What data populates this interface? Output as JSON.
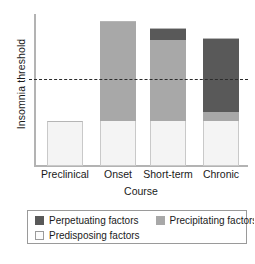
{
  "chart_data": {
    "type": "bar",
    "stacked": true,
    "title": "",
    "xlabel": "Course",
    "ylabel": "Insomnia threshold",
    "categories": [
      "Preclinical",
      "Onset",
      "Short-term",
      "Chronic"
    ],
    "series": [
      {
        "name": "Predisposing factors",
        "color": "#f4f4f4",
        "values": [
          45,
          45,
          45,
          45
        ]
      },
      {
        "name": "Precipitating factors",
        "color": "#a8a8a8",
        "values": [
          0,
          100,
          81,
          9
        ]
      },
      {
        "name": "Perpetuating factors",
        "color": "#595959",
        "values": [
          0,
          0,
          12,
          74
        ]
      }
    ],
    "totals": [
      45,
      145,
      138,
      128
    ],
    "threshold": {
      "label": "Insomnia threshold",
      "value": 87,
      "style": "dashed",
      "color": "#2b2b2b"
    },
    "ylim": [
      0,
      152
    ],
    "grid": false,
    "legend_position": "bottom"
  },
  "axes": {
    "y_title": "Insomnia threshold",
    "x_title": "Course"
  },
  "bars": [
    {
      "category": "Preclinical",
      "segments": [
        {
          "name": "Predisposing factors",
          "class": "seg-predisposing",
          "height_px": 45
        }
      ]
    },
    {
      "category": "Onset",
      "segments": [
        {
          "name": "Precipitating factors",
          "class": "seg-precipitating",
          "height_px": 100
        },
        {
          "name": "Predisposing factors",
          "class": "seg-predisposing",
          "height_px": 45
        }
      ]
    },
    {
      "category": "Short-term",
      "segments": [
        {
          "name": "Perpetuating factors",
          "class": "seg-perpetuating",
          "height_px": 12
        },
        {
          "name": "Precipitating factors",
          "class": "seg-precipitating",
          "height_px": 81
        },
        {
          "name": "Predisposing factors",
          "class": "seg-predisposing",
          "height_px": 45
        }
      ]
    },
    {
      "category": "Chronic",
      "segments": [
        {
          "name": "Perpetuating factors",
          "class": "seg-perpetuating",
          "height_px": 74
        },
        {
          "name": "Precipitating factors",
          "class": "seg-precipitating",
          "height_px": 9
        },
        {
          "name": "Predisposing factors",
          "class": "seg-predisposing",
          "height_px": 45
        }
      ]
    }
  ],
  "legend": {
    "items": [
      {
        "label": "Perpetuating factors",
        "swatch_class": "sw-perpetuating",
        "color": "#595959"
      },
      {
        "label": "Precipitating factors",
        "swatch_class": "sw-precipitating",
        "color": "#a8a8a8"
      },
      {
        "label": "Predisposing factors",
        "swatch_class": "sw-predisposing",
        "color": "#fbfbfb"
      }
    ]
  },
  "layout": {
    "bar_x": [
      47,
      100,
      150,
      203
    ],
    "bar_width": 36,
    "baseline_y": 165,
    "label_centers": [
      65,
      118,
      168,
      221
    ]
  }
}
